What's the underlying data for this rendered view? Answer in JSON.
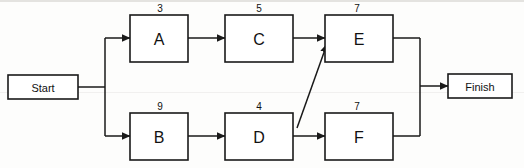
{
  "diagram": {
    "type": "activity-on-node-network",
    "colors": {
      "background": "#fdfdfc",
      "stroke": "#1a1a1a",
      "node_fill": "#ffffff",
      "text": "#111111"
    },
    "terminals": [
      {
        "id": "start",
        "label": "Start"
      },
      {
        "id": "finish",
        "label": "Finish"
      }
    ],
    "nodes": [
      {
        "id": "A",
        "label": "A",
        "duration": "3"
      },
      {
        "id": "C",
        "label": "C",
        "duration": "5"
      },
      {
        "id": "E",
        "label": "E",
        "duration": "7"
      },
      {
        "id": "B",
        "label": "B",
        "duration": "9"
      },
      {
        "id": "D",
        "label": "D",
        "duration": "4"
      },
      {
        "id": "F",
        "label": "F",
        "duration": "7"
      }
    ],
    "edges": [
      {
        "from": "Start",
        "to": "A"
      },
      {
        "from": "Start",
        "to": "B"
      },
      {
        "from": "A",
        "to": "C"
      },
      {
        "from": "C",
        "to": "E"
      },
      {
        "from": "B",
        "to": "D"
      },
      {
        "from": "D",
        "to": "E"
      },
      {
        "from": "D",
        "to": "F"
      },
      {
        "from": "E",
        "to": "Finish"
      },
      {
        "from": "F",
        "to": "Finish"
      }
    ]
  }
}
